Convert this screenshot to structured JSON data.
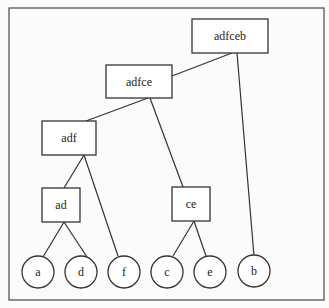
{
  "diagram": {
    "type": "hierarchical-clustering-tree",
    "internal_nodes": [
      {
        "id": "adfceb",
        "label": "adfceb"
      },
      {
        "id": "adfce",
        "label": "adfce"
      },
      {
        "id": "adf",
        "label": "adf"
      },
      {
        "id": "ad",
        "label": "ad"
      },
      {
        "id": "ce",
        "label": "ce"
      }
    ],
    "leaves": [
      {
        "id": "a",
        "label": "a"
      },
      {
        "id": "d",
        "label": "d"
      },
      {
        "id": "f",
        "label": "f"
      },
      {
        "id": "c",
        "label": "c"
      },
      {
        "id": "e",
        "label": "e"
      },
      {
        "id": "b",
        "label": "b"
      }
    ],
    "edges": [
      [
        "adfceb",
        "adfce"
      ],
      [
        "adfceb",
        "b"
      ],
      [
        "adfce",
        "adf"
      ],
      [
        "adfce",
        "ce"
      ],
      [
        "adf",
        "ad"
      ],
      [
        "adf",
        "f"
      ],
      [
        "ad",
        "a"
      ],
      [
        "ad",
        "d"
      ],
      [
        "ce",
        "c"
      ],
      [
        "ce",
        "e"
      ]
    ]
  }
}
